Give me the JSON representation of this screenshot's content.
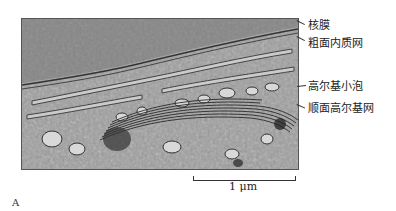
{
  "figure": {
    "panel_letter": "A",
    "image_description": "Transmission electron micrograph of a Golgi apparatus region",
    "labels": [
      {
        "text": "核膜",
        "meaning": "nuclear envelope"
      },
      {
        "text": "粗面内质网",
        "meaning": "rough endoplasmic reticulum"
      },
      {
        "text": "高尔基小泡",
        "meaning": "Golgi vesicle"
      },
      {
        "text": "顺面高尔基网",
        "meaning": "cis-Golgi network"
      }
    ],
    "scale_bar": {
      "text": "1 μm"
    }
  }
}
